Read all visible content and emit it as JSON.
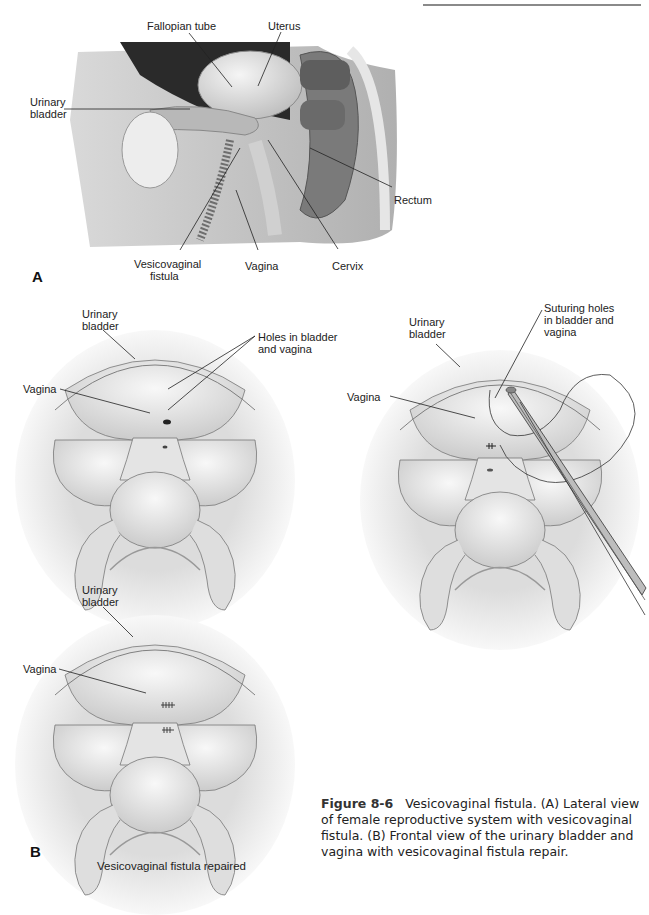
{
  "header": {
    "rule": true
  },
  "panel_a": {
    "letter": "A",
    "view": "Lateral view",
    "labels": {
      "fallopian_tube": "Fallopian tube",
      "uterus": "Uterus",
      "urinary_bladder_l1": "Urinary",
      "urinary_bladder_l2": "bladder",
      "rectum": "Rectum",
      "vesicovaginal_fistula_l1": "Vesicovaginal",
      "vesicovaginal_fistula_l2": "fistula",
      "vagina": "Vagina",
      "cervix": "Cervix"
    }
  },
  "panel_b": {
    "letter": "B",
    "view_fistula": {
      "urinary_bladder_l1": "Urinary",
      "urinary_bladder_l2": "bladder",
      "holes_l1": "Holes in bladder",
      "holes_l2": "and vagina",
      "vagina": "Vagina"
    },
    "view_suturing": {
      "urinary_bladder_l1": "Urinary",
      "urinary_bladder_l2": "bladder",
      "suturing_l1": "Suturing holes",
      "suturing_l2": "in bladder and",
      "suturing_l3": "vagina",
      "vagina": "Vagina"
    },
    "view_repaired": {
      "urinary_bladder_l1": "Urinary",
      "urinary_bladder_l2": "bladder",
      "vagina": "Vagina",
      "subcaption": "Vesicovaginal fistula repaired"
    }
  },
  "caption": {
    "figure_label": "Figure 8-6",
    "text": "Vesicovaginal fistula. (A) Lateral view of female reproductive system with vesicovaginal fistula. (B) Frontal view of the urinary bladder and vagina with vesicovaginal fistula repair."
  }
}
